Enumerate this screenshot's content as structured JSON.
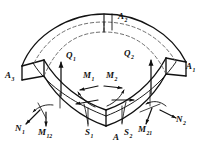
{
  "figure": {
    "kind": "shell-element-force-diagram",
    "background_color": "#ffffff",
    "line_color": "#111111",
    "dashed_color": "#555555"
  },
  "labels": {
    "corner_A": {
      "base": "A",
      "sub": "",
      "x": 113,
      "y": 139
    },
    "corner_A1": {
      "base": "A",
      "sub": "1",
      "x": 186,
      "y": 68
    },
    "corner_A2": {
      "base": "A",
      "sub": "2",
      "x": 118,
      "y": 18
    },
    "corner_A3": {
      "base": "A",
      "sub": "3",
      "x": 8,
      "y": 76
    },
    "shear_Q1": {
      "base": "Q",
      "sub": "1",
      "x": 66,
      "y": 56
    },
    "shear_Q2": {
      "base": "Q",
      "sub": "2",
      "x": 124,
      "y": 54
    },
    "moment_M1": {
      "base": "M",
      "sub": "1",
      "x": 85,
      "y": 76
    },
    "moment_M2": {
      "base": "M",
      "sub": "2",
      "x": 107,
      "y": 76
    },
    "force_N1": {
      "base": "N",
      "sub": "1",
      "x": 18,
      "y": 128
    },
    "force_N2": {
      "base": "N",
      "sub": "2",
      "x": 176,
      "y": 121
    },
    "twist_M12": {
      "base": "M",
      "sub": "12",
      "x": 42,
      "y": 133
    },
    "twist_M21": {
      "base": "M",
      "sub": "21",
      "x": 141,
      "y": 130
    },
    "shear_S1": {
      "base": "S",
      "sub": "1",
      "x": 86,
      "y": 133
    },
    "shear_S2": {
      "base": "S",
      "sub": "2",
      "x": 124,
      "y": 133
    }
  }
}
